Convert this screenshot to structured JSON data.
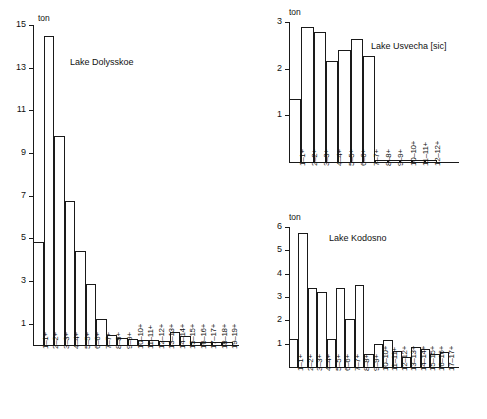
{
  "figure": {
    "background": "#ffffff",
    "ink_color": "#1a1a1a",
    "unit_label": "ton"
  },
  "chart_data": [
    {
      "id": "lake-dolysskoe",
      "type": "bar",
      "title": "Lake Dolysskoe",
      "ylabel": "ton",
      "xlabel": "",
      "ylim": [
        0,
        15
      ],
      "yticks": [
        1,
        3,
        5,
        7,
        9,
        11,
        13,
        15
      ],
      "grid": false,
      "legend": "none",
      "categories": [
        "1–1+",
        "2–2+",
        "3–3+",
        "4–4+",
        "5–5+",
        "6–6+",
        "7–7+",
        "8–8+",
        "9–9+",
        "10–10+",
        "11–11+",
        "12–12+",
        "13–13+",
        "14–14+",
        "15–15+",
        "16–16+",
        "17–17+",
        "18–18+",
        "19–19+"
      ],
      "values": [
        4.85,
        14.5,
        9.8,
        6.75,
        4.4,
        2.85,
        1.2,
        0.45,
        0.35,
        0.3,
        0.25,
        0.25,
        0.2,
        0.6,
        0.4,
        0.15,
        0.15,
        0.15,
        0.15
      ]
    },
    {
      "id": "lake-usvecha",
      "type": "bar",
      "title": "Lake Usvecha  [sic]",
      "ylabel": "ton",
      "xlabel": "",
      "ylim": [
        0,
        3
      ],
      "yticks": [
        1,
        2,
        3
      ],
      "grid": false,
      "legend": "none",
      "categories": [
        "1–1+",
        "2–2+",
        "3–3+",
        "4–4+",
        "5–5+",
        "6–6+",
        "7–7+",
        "8–8+",
        "9–9+",
        "10–10+",
        "11–11+",
        "12–12+"
      ],
      "values": [
        1.35,
        2.9,
        2.78,
        2.17,
        2.4,
        2.63,
        2.28,
        0.04,
        0.04,
        0.04,
        0.04,
        0.04
      ]
    },
    {
      "id": "lake-kodosno",
      "type": "bar",
      "title": "Lake Kodosno",
      "ylabel": "ton",
      "xlabel": "",
      "ylim": [
        0,
        6
      ],
      "yticks": [
        1,
        2,
        3,
        4,
        5,
        6
      ],
      "grid": false,
      "legend": "none",
      "categories": [
        "1–1+",
        "2–2+",
        "3–3+",
        "4–4+",
        "5–5+",
        "6–6+",
        "7–7+",
        "8–8+",
        "9–9+",
        "10–10+",
        "11–11+",
        "12–12+",
        "13–13+",
        "14–14+",
        "15–15+",
        "16–16+",
        "17–17+"
      ],
      "values": [
        1.22,
        5.75,
        3.4,
        3.22,
        1.2,
        3.4,
        2.05,
        3.53,
        0.55,
        1.0,
        1.15,
        0.68,
        0.45,
        0.85,
        0.78,
        0.55,
        0.65
      ]
    }
  ]
}
